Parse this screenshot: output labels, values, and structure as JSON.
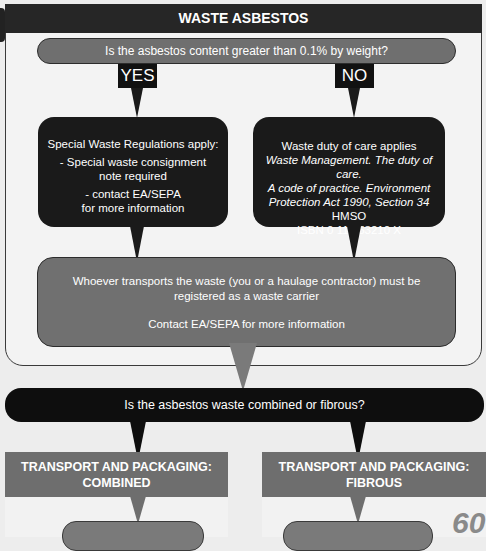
{
  "title": "WASTE ASBESTOS",
  "question1": "Is the asbestos content greater than 0.1% by weight?",
  "answers": {
    "yes": "YES",
    "no": "NO"
  },
  "yes_box": {
    "line1": "Special Waste Regulations apply:",
    "line2a": "- Special waste consignment",
    "line2b": "note required",
    "line3a": "- contact EA/SEPA",
    "line3b": "for more information"
  },
  "no_box": {
    "line1": "Waste duty of care applies",
    "line2": "Waste Management. The duty of care.",
    "line3": "A code of practice. Environment",
    "line4_italic": "Protection Act 1990, Section 34",
    "line4_normal": " HMSO",
    "line5": "ISBN 0 11 753210 X"
  },
  "carrier_box": {
    "line1": "Whoever transports the waste (you or a haulage contractor) must be",
    "line2": "registered as a waste carrier",
    "line3": "Contact EA/SEPA for more information"
  },
  "question2": "Is the asbestos waste combined or fibrous?",
  "sections": [
    {
      "line1": "TRANSPORT AND PACKAGING:",
      "line2": "COMBINED"
    },
    {
      "line1": "TRANSPORT AND PACKAGING:",
      "line2": "FIBROUS"
    }
  ],
  "page_number": "60",
  "colors": {
    "dark": "#1a1a1a",
    "gray": "#6f6f6f",
    "background": "#f3f3f3"
  }
}
